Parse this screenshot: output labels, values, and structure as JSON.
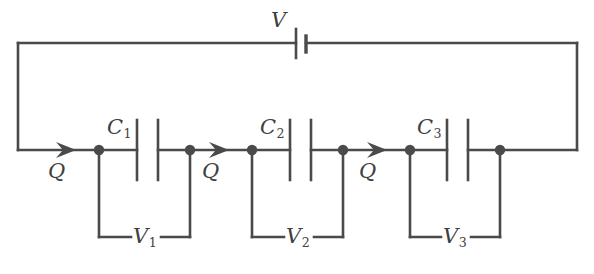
{
  "figure": {
    "type": "circuit-diagram",
    "stroke_color": "#4a4a4a",
    "background_color": "#ffffff",
    "text_color": "#3f3f3f"
  },
  "source": {
    "battery_label": "V",
    "capacitor_labels": [
      "C1",
      "C2",
      "C3"
    ],
    "voltage_labels": [
      "V1",
      "V2",
      "V3"
    ],
    "charge_labels": [
      "Q",
      "Q",
      "Q"
    ]
  },
  "battery": {
    "name": "V",
    "symbol_long_plate": true,
    "symbol_short_plate": true
  },
  "capacitors": [
    {
      "id": "C1",
      "base": "C",
      "sub": "1"
    },
    {
      "id": "C2",
      "base": "C",
      "sub": "2"
    },
    {
      "id": "C3",
      "base": "C",
      "sub": "3"
    }
  ],
  "voltages": [
    {
      "id": "V1",
      "base": "V",
      "sub": "1"
    },
    {
      "id": "V2",
      "base": "V",
      "sub": "2"
    },
    {
      "id": "V3",
      "base": "V",
      "sub": "3"
    }
  ],
  "charges": [
    {
      "id": "Q1",
      "text": "Q"
    },
    {
      "id": "Q2",
      "text": "Q"
    },
    {
      "id": "Q3",
      "text": "Q"
    }
  ]
}
